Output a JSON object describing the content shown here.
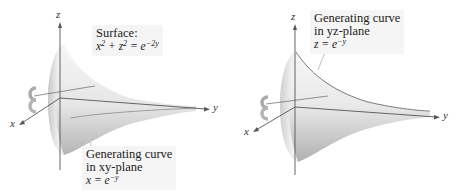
{
  "figures": [
    {
      "id": "left",
      "axes": {
        "x": "x",
        "y": "y",
        "z": "z"
      },
      "label": {
        "line1": "Surface:",
        "eq_lhs_a": "x",
        "eq_exp_a": "2",
        "eq_plus": " + ",
        "eq_lhs_b": "z",
        "eq_exp_b": "2",
        "eq_eq": " = e",
        "eq_exp_rhs": "−2y"
      },
      "label2": {
        "line1": "Generating curve",
        "line2": "in xy-plane",
        "eq": "x = e",
        "eq_exp": "−y"
      }
    },
    {
      "id": "right",
      "axes": {
        "x": "x",
        "y": "y",
        "z": "z"
      },
      "label": {
        "line1": "Generating curve",
        "line2": "in yz-plane",
        "eq": "z = e",
        "eq_exp": "−y"
      }
    }
  ],
  "colors": {
    "surface_light": "#f4f4f4",
    "surface_dark": "#bdbdbd",
    "axis": "#555555",
    "label_bg": "#f2f2f2"
  }
}
